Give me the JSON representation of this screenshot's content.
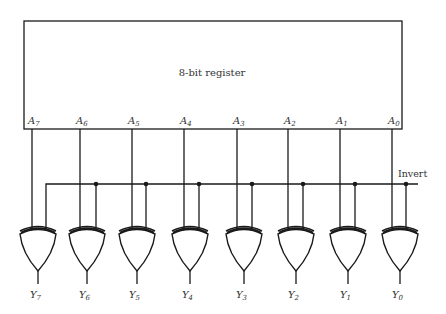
{
  "register": {
    "label": "8-bit register"
  },
  "inputs": [
    {
      "letter": "A",
      "sub": "7"
    },
    {
      "letter": "A",
      "sub": "6"
    },
    {
      "letter": "A",
      "sub": "5"
    },
    {
      "letter": "A",
      "sub": "4"
    },
    {
      "letter": "A",
      "sub": "3"
    },
    {
      "letter": "A",
      "sub": "2"
    },
    {
      "letter": "A",
      "sub": "1"
    },
    {
      "letter": "A",
      "sub": "0"
    }
  ],
  "outputs": [
    {
      "letter": "Y",
      "sub": "7"
    },
    {
      "letter": "Y",
      "sub": "6"
    },
    {
      "letter": "Y",
      "sub": "5"
    },
    {
      "letter": "Y",
      "sub": "4"
    },
    {
      "letter": "Y",
      "sub": "3"
    },
    {
      "letter": "Y",
      "sub": "2"
    },
    {
      "letter": "Y",
      "sub": "1"
    },
    {
      "letter": "Y",
      "sub": "0"
    }
  ],
  "control": {
    "label": "Invert"
  },
  "gate_type": "xor-gate",
  "colors": {
    "line": "#1a1a1a",
    "text": "#333333",
    "background": "#ffffff"
  }
}
